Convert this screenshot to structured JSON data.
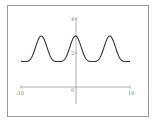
{
  "chart_data": {
    "type": "line",
    "title": "",
    "xlabel": "",
    "ylabel": "",
    "xlim": [
      -10,
      10
    ],
    "ylim": [
      -2,
      4
    ],
    "x_tick_labels": [
      "-10",
      "0",
      "10"
    ],
    "y_tick_labels": [
      "2",
      "4"
    ],
    "grid": false,
    "legend": null,
    "series": [
      {
        "name": "periodic curve",
        "color": "#333333",
        "x": [
          -10,
          -8.5,
          -7,
          -6.28,
          -5.5,
          -4.5,
          -3.14,
          -2,
          -1,
          0,
          1,
          2,
          3.14,
          4.5,
          5.5,
          6.28,
          7,
          8.5,
          10
        ],
        "y": [
          1.55,
          1.6,
          2.6,
          3.0,
          2.6,
          1.7,
          1.5,
          1.7,
          2.6,
          3.0,
          2.6,
          1.7,
          1.5,
          1.7,
          2.6,
          3.0,
          2.6,
          1.6,
          1.55
        ]
      }
    ],
    "axes_origin": [
      0,
      0
    ]
  },
  "labels": {
    "x_min": "-10",
    "x_max": "10",
    "origin": "0",
    "y_top": "4",
    "y_mid": "2"
  }
}
